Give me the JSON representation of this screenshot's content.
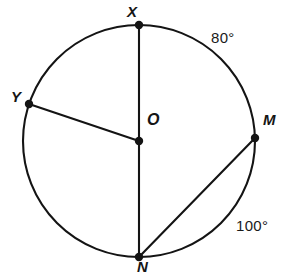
{
  "figure": {
    "stroke_color": "#141414",
    "background_color": "#ffffff",
    "circle": {
      "center_label": "O",
      "center_x": 139,
      "center_y": 141,
      "radius": 116
    },
    "points": [
      {
        "id": "X",
        "label": "X",
        "x": 139,
        "y": 25,
        "angle_deg": 90
      },
      {
        "id": "M",
        "label": "M",
        "x": 255,
        "y": 138,
        "angle_deg": 1.5
      },
      {
        "id": "N",
        "label": "N",
        "x": 139,
        "y": 257,
        "angle_deg": 270
      },
      {
        "id": "Y",
        "label": "Y",
        "x": 29,
        "y": 104,
        "angle_deg": 161
      },
      {
        "id": "O",
        "label": "O",
        "x": 139,
        "y": 141,
        "angle_deg": 0
      }
    ],
    "segments": [
      {
        "id": "OX",
        "from": "O",
        "to": "X",
        "kind": "radius"
      },
      {
        "id": "OY",
        "from": "O",
        "to": "Y",
        "kind": "radius"
      },
      {
        "id": "ON",
        "from": "O",
        "to": "N",
        "kind": "radius"
      },
      {
        "id": "NM",
        "from": "N",
        "to": "M",
        "kind": "chord"
      }
    ],
    "arc_labels": [
      {
        "id": "arc-XM",
        "text": "80°",
        "arc": "XM",
        "value": 80
      },
      {
        "id": "arc-MN",
        "text": "100°",
        "arc": "MN",
        "value": 100
      }
    ]
  }
}
